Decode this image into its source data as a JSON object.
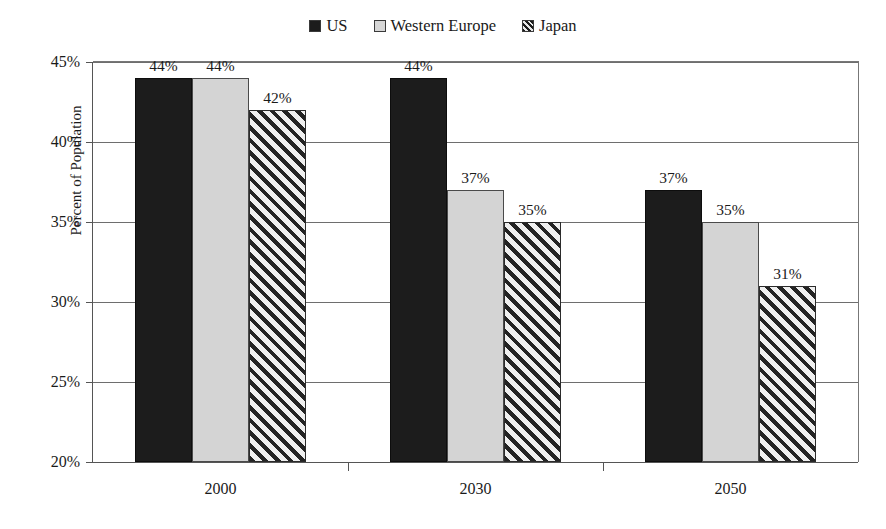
{
  "chart_data": {
    "type": "bar",
    "title": "",
    "xlabel": "",
    "ylabel": "Percent of Population",
    "categories": [
      "2000",
      "2030",
      "2050"
    ],
    "series": [
      {
        "name": "US",
        "values": [
          44,
          44,
          37
        ],
        "color": "#1c1c1c",
        "fill": "solid-dark"
      },
      {
        "name": "Western Europe",
        "values": [
          44,
          37,
          35
        ],
        "color": "#d4d4d4",
        "fill": "solid-light"
      },
      {
        "name": "Japan",
        "values": [
          42,
          35,
          31
        ],
        "color": "#232323",
        "fill": "diagonal-hatch"
      }
    ],
    "ylim": [
      20,
      45
    ],
    "ytick_step": 5,
    "ytick_labels": [
      "45%",
      "40%",
      "35%",
      "30%",
      "25%",
      "20%"
    ],
    "ytick_values": [
      45,
      40,
      35,
      30,
      25,
      20
    ],
    "grid": true,
    "legend_position": "top-center",
    "value_label_suffix": "%"
  },
  "legend": {
    "entries": [
      {
        "label": "US",
        "swatch": "solid-dark-swatch"
      },
      {
        "label": "Western Europe",
        "swatch": "solid-light-swatch"
      },
      {
        "label": "Japan",
        "swatch": "hatched-swatch"
      }
    ]
  },
  "axes": {
    "y_title": "Percent of Population",
    "y_labels": [
      "45%",
      "40%",
      "35%",
      "30%",
      "25%",
      "20%"
    ],
    "x_labels": [
      "2000",
      "2030",
      "2050"
    ]
  },
  "bars": [
    {
      "group": "2000",
      "series": "US",
      "value": 44,
      "label": "44%"
    },
    {
      "group": "2000",
      "series": "Western Europe",
      "value": 44,
      "label": "44%"
    },
    {
      "group": "2000",
      "series": "Japan",
      "value": 42,
      "label": "42%"
    },
    {
      "group": "2030",
      "series": "US",
      "value": 37,
      "label": "37%"
    },
    {
      "group": "2030",
      "series": "Western Europe",
      "value": 37,
      "label": "37%"
    },
    {
      "group": "2030",
      "series": "Japan",
      "value": 35,
      "label": "35%"
    },
    {
      "group": "2050",
      "series": "US",
      "value": 36,
      "label": "36%"
    },
    {
      "group": "2050",
      "series": "Western Europe",
      "value": 35,
      "label": "35%"
    },
    {
      "group": "2050",
      "series": "Japan",
      "value": 31,
      "label": "31%"
    }
  ]
}
